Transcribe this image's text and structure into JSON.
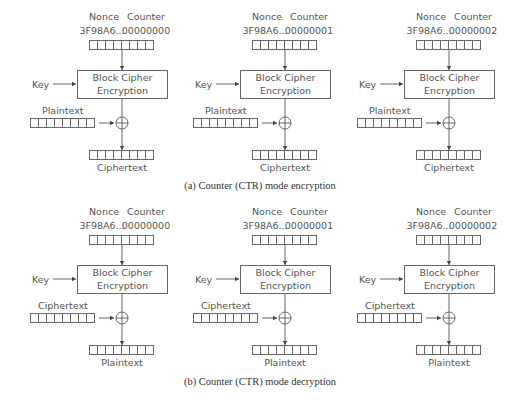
{
  "figure": {
    "panels": [
      {
        "id": "a",
        "caption": "(a) Counter (CTR) mode encryption",
        "columns": [
          {
            "nonce_label": "Nonce",
            "counter_label": "Counter",
            "nonce_value": "3F98A6...",
            "counter_value": "00000000",
            "key_label": "Key",
            "block_line1": "Block Cipher",
            "block_line2": "Encryption",
            "input_label": "Plaintext",
            "output_label": "Ciphertext"
          },
          {
            "nonce_label": "Nonce",
            "counter_label": "Counter",
            "nonce_value": "3F98A6...",
            "counter_value": "00000001",
            "key_label": "Key",
            "block_line1": "Block Cipher",
            "block_line2": "Encryption",
            "input_label": "Plaintext",
            "output_label": "Ciphertext"
          },
          {
            "nonce_label": "Nonce",
            "counter_label": "Counter",
            "nonce_value": "3F98A6...",
            "counter_value": "00000002",
            "key_label": "Key",
            "block_line1": "Block Cipher",
            "block_line2": "Encryption",
            "input_label": "Plaintext",
            "output_label": "Ciphertext"
          }
        ]
      },
      {
        "id": "b",
        "caption": "(b) Counter (CTR) mode decryption",
        "columns": [
          {
            "nonce_label": "Nonce",
            "counter_label": "Counter",
            "nonce_value": "3F98A6...",
            "counter_value": "00000000",
            "key_label": "Key",
            "block_line1": "Block Cipher",
            "block_line2": "Encryption",
            "input_label": "Ciphertext",
            "output_label": "Plaintext"
          },
          {
            "nonce_label": "Nonce",
            "counter_label": "Counter",
            "nonce_value": "3F98A6...",
            "counter_value": "00000001",
            "key_label": "Key",
            "block_line1": "Block Cipher",
            "block_line2": "Encryption",
            "input_label": "Ciphertext",
            "output_label": "Plaintext"
          },
          {
            "nonce_label": "Nonce",
            "counter_label": "Counter",
            "nonce_value": "3F98A6...",
            "counter_value": "00000002",
            "key_label": "Key",
            "block_line1": "Block Cipher",
            "block_line2": "Encryption",
            "input_label": "Ciphertext",
            "output_label": "Plaintext"
          }
        ]
      }
    ],
    "register_cells": 8,
    "colors": {
      "line": "#666666",
      "text": "#555555",
      "caption": "#333333"
    }
  }
}
